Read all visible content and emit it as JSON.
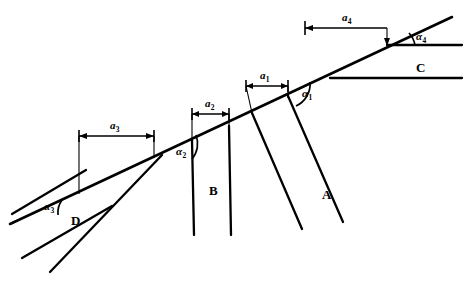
{
  "figure": {
    "background_color": "#ffffff",
    "line_color": "#000000",
    "blocks": [
      {
        "id": "A",
        "label": "A",
        "label_x": 322,
        "label_y": 188
      },
      {
        "id": "B",
        "label": "B",
        "label_x": 209,
        "label_y": 184
      },
      {
        "id": "C",
        "label": "C",
        "label_x": 416,
        "label_y": 61
      },
      {
        "id": "D",
        "label": "D",
        "label_x": 71,
        "label_y": 214
      }
    ],
    "dimensions": [
      {
        "id": "a1",
        "label": "a",
        "sub": "1",
        "label_x": 260,
        "label_y": 76,
        "line_y": 86,
        "x_start": 246,
        "x_end": 288
      },
      {
        "id": "a2",
        "label": "a",
        "sub": "2",
        "label_x": 205,
        "label_y": 104,
        "line_y": 114,
        "x_start": 192,
        "x_end": 229
      },
      {
        "id": "a3",
        "label": "a",
        "sub": "3",
        "label_x": 112,
        "label_y": 126,
        "line_y": 136,
        "x_start": 79,
        "x_end": 154
      },
      {
        "id": "a4",
        "label": "a",
        "sub": "4",
        "label_x": 348,
        "label_y": 18,
        "line_y": 28,
        "x_start": 305,
        "x_end": 387
      }
    ],
    "angles": [
      {
        "id": "alpha1",
        "label": "α",
        "sub": "1",
        "label_x": 302,
        "label_y": 94
      },
      {
        "id": "alpha2",
        "label": "α",
        "sub": "2",
        "label_x": 178,
        "label_y": 152
      },
      {
        "id": "alpha3",
        "label": "α",
        "sub": "3",
        "label_x": 46,
        "label_y": 207
      },
      {
        "id": "alpha4",
        "label": "α",
        "sub": "4",
        "label_x": 418,
        "label_y": 37
      }
    ]
  }
}
